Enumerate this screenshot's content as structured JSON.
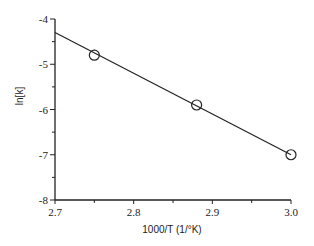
{
  "chart_data": {
    "type": "scatter",
    "title": "",
    "xlabel": "1000/T (1/°K)",
    "ylabel": "ln[k]",
    "xlim": [
      2.7,
      3.0
    ],
    "ylim": [
      -8,
      -4
    ],
    "x_ticks": [
      2.7,
      2.8,
      2.9,
      3.0
    ],
    "x_tick_labels": [
      "2.7",
      "2.8",
      "2.9",
      "3.0"
    ],
    "x_minor_ticks": [
      2.75,
      2.85,
      2.95
    ],
    "y_ticks": [
      -4,
      -5,
      -6,
      -7,
      -8
    ],
    "y_tick_labels": [
      "-4",
      "-5",
      "-6",
      "-7",
      "-8"
    ],
    "y_minor_ticks": [
      -4.5,
      -5.5,
      -6.5,
      -7.5
    ],
    "grid": false,
    "legend": null,
    "series": [
      {
        "name": "data",
        "marker": "open-circle",
        "x": [
          2.75,
          2.88,
          3.0
        ],
        "y": [
          -4.8,
          -5.9,
          -7.0
        ]
      },
      {
        "name": "linear fit",
        "style": "line",
        "x": [
          2.7,
          3.0
        ],
        "y": [
          -4.3,
          -7.0
        ]
      }
    ]
  },
  "colors": {
    "axis": "#222222",
    "line": "#222222",
    "marker": "#222222",
    "background": "#ffffff"
  }
}
